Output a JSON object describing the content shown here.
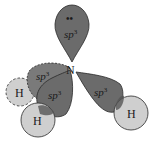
{
  "diagram": {
    "central_atom": {
      "label": "N"
    },
    "lone_pair": {
      "symbol": "••"
    },
    "orbitals": [
      {
        "id": "top",
        "label": "sp",
        "sup": "3",
        "role": "lone pair"
      },
      {
        "id": "back-left",
        "label": "sp",
        "sup": "3",
        "role": "bonding"
      },
      {
        "id": "front-left",
        "label": "sp",
        "sup": "3",
        "role": "bonding"
      },
      {
        "id": "right",
        "label": "sp",
        "sup": "3",
        "role": "bonding"
      }
    ],
    "hydrogens": [
      {
        "id": "h-back",
        "label": "H",
        "style": "dashed"
      },
      {
        "id": "h-front",
        "label": "H",
        "style": "solid"
      },
      {
        "id": "h-right",
        "label": "H",
        "style": "solid"
      }
    ],
    "colors": {
      "orbital_fill": "#6b6b6b",
      "orbital_back_fill": "#7a7a7a",
      "hydrogen_fill": "#cfcfcf",
      "overlap_fill": "#555555",
      "stroke": "#2a2a2a"
    }
  }
}
